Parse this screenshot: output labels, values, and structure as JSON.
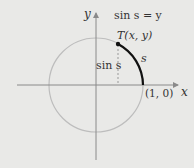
{
  "diagram": {
    "y_axis_label": "y",
    "x_axis_label": "x",
    "equation": "sin s = y",
    "point_label": "T(x, y)",
    "arc_label": "s",
    "vertical_label": "sin s",
    "origin_point_label": "(1, 0)",
    "colors": {
      "background": "#e9e9e7",
      "circle": "#b8b8b8",
      "axes": "#8a8a8a",
      "arc": "#111111",
      "text": "#333333"
    }
  }
}
